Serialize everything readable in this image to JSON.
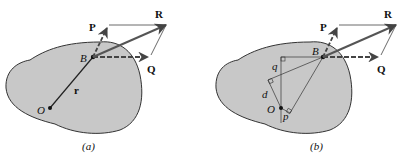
{
  "figure": {
    "colors": {
      "body_fill": "#c8c8c8",
      "stroke": "#333333",
      "vector": "#555555"
    },
    "panels": [
      {
        "id": "a",
        "caption": "(a)",
        "labels": {
          "P": "P",
          "R": "R",
          "Q": "Q",
          "B": "B",
          "O": "O",
          "r": "r"
        }
      },
      {
        "id": "b",
        "caption": "(b)",
        "labels": {
          "P": "P",
          "R": "R",
          "Q": "Q",
          "B": "B",
          "O": "O",
          "q": "q",
          "d": "d",
          "p": "p"
        }
      }
    ]
  }
}
